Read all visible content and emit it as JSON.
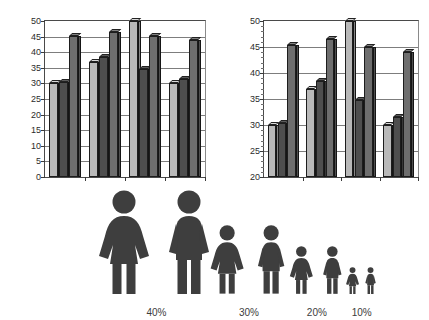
{
  "chart_data": [
    {
      "type": "bar",
      "title": "",
      "xlabel": "",
      "ylabel": "",
      "ylim": [
        0,
        50
      ],
      "yticks": [
        0,
        5,
        10,
        15,
        20,
        25,
        30,
        35,
        40,
        45,
        50
      ],
      "grid": true,
      "legend": "none",
      "categories": [
        "1",
        "2",
        "3",
        "4"
      ],
      "series": [
        {
          "name": "Series 1",
          "color": "#b9b9b9",
          "values": [
            30,
            37,
            50,
            30
          ]
        },
        {
          "name": "Series 2",
          "color": "#4e4e4e",
          "values": [
            30.3,
            38.5,
            34.5,
            31.5
          ]
        },
        {
          "name": "Series 3",
          "color": "#6e6e6e",
          "values": [
            45.3,
            46.5,
            45.2,
            44
          ]
        }
      ]
    },
    {
      "type": "bar",
      "title": "",
      "xlabel": "",
      "ylabel": "",
      "ylim": [
        20,
        50
      ],
      "yticks": [
        20,
        25,
        30,
        35,
        40,
        45,
        50
      ],
      "grid": true,
      "legend": "none",
      "categories": [
        "1",
        "2",
        "3",
        "4"
      ],
      "series": [
        {
          "name": "Series 1",
          "color": "#b9b9b9",
          "values": [
            30,
            37,
            50,
            30
          ]
        },
        {
          "name": "Series 2",
          "color": "#4e4e4e",
          "values": [
            30.3,
            38.5,
            34.8,
            31.5
          ]
        },
        {
          "name": "Series 3",
          "color": "#6e6e6e",
          "values": [
            45.3,
            46.5,
            45,
            44
          ]
        }
      ]
    }
  ],
  "charts": {
    "left": {
      "name": "bar-chart-full-scale",
      "yticks": [
        "0",
        "5",
        "10",
        "15",
        "20",
        "25",
        "30",
        "35",
        "40",
        "45",
        "50"
      ]
    },
    "right": {
      "name": "bar-chart-zoomed-scale",
      "yticks": [
        "20",
        "25",
        "30",
        "35",
        "40",
        "45",
        "50"
      ]
    }
  },
  "pictograms": {
    "groups": [
      {
        "label": "40%",
        "scale": 1.0,
        "figures": [
          "female",
          "male"
        ]
      },
      {
        "label": "30%",
        "scale": 0.66,
        "figures": [
          "female",
          "male"
        ]
      },
      {
        "label": "20%",
        "scale": 0.46,
        "figures": [
          "female",
          "male"
        ]
      },
      {
        "label": "10%",
        "scale": 0.26,
        "figures": [
          "female",
          "male"
        ]
      }
    ]
  },
  "colors": {
    "series_light": "#b9b9b9",
    "series_dark": "#4e4e4e",
    "series_mid": "#6e6e6e",
    "pictogram": "#3e3e3e",
    "axis": "#3a3a3a",
    "grid": "#7d7d7d"
  }
}
